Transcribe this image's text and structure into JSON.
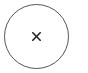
{
  "close_button": {
    "icon": "close-icon",
    "glyph": "×",
    "border_color": "#555555",
    "icon_color": "#222222",
    "background": "#ffffff"
  }
}
